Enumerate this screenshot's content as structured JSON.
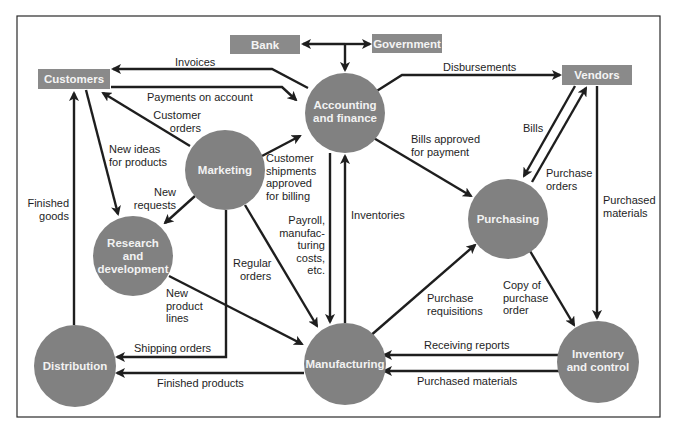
{
  "colors": {
    "node_fill": "#818181",
    "box_fill": "#8a8a8a",
    "node_text": "#f2f2f2",
    "arrow": "#1e1e1e",
    "frame": "#2a2a2a",
    "background": "#ffffff"
  },
  "external_entities": {
    "bank": "Bank",
    "government": "Government",
    "customers": "Customers",
    "vendors": "Vendors"
  },
  "functions": {
    "accounting": [
      "Accounting",
      "and finance"
    ],
    "marketing": [
      "Marketing"
    ],
    "research": [
      "Research",
      "and",
      "development"
    ],
    "purchasing": [
      "Purchasing"
    ],
    "distribution": [
      "Distribution"
    ],
    "manufacturing": [
      "Manufacturing"
    ],
    "inventory": [
      "Inventory",
      "and control"
    ]
  },
  "flows": {
    "invoices": [
      "Invoices"
    ],
    "payments_on_account": [
      "Payments on account"
    ],
    "customer_orders": [
      "Customer",
      "orders"
    ],
    "new_ideas": [
      "New ideas",
      "for products"
    ],
    "new_requests": [
      "New",
      "requests"
    ],
    "customer_shipments": [
      "Customer",
      "shipments",
      "approved",
      "for billing"
    ],
    "disbursements": [
      "Disbursements"
    ],
    "bills_approved": [
      "Bills approved",
      "for payment"
    ],
    "bills": [
      "Bills"
    ],
    "purchase_orders": [
      "Purchase",
      "orders"
    ],
    "purchased_materials_vendor": [
      "Purchased",
      "materials"
    ],
    "finished_goods": [
      "Finished",
      "goods"
    ],
    "payroll": [
      "Payroll,",
      "manufac-",
      "turing",
      "costs,",
      "etc."
    ],
    "inventories": [
      "Inventories"
    ],
    "regular_orders": [
      "Regular",
      "orders"
    ],
    "new_product_lines": [
      "New",
      "product",
      "lines"
    ],
    "purchase_requisitions": [
      "Purchase",
      "requisitions"
    ],
    "copy_of_po": [
      "Copy of",
      "purchase",
      "order"
    ],
    "shipping_orders": [
      "Shipping orders"
    ],
    "finished_products": [
      "Finished products"
    ],
    "receiving_reports": [
      "Receiving reports"
    ],
    "purchased_materials_inventory": [
      "Purchased materials"
    ]
  }
}
